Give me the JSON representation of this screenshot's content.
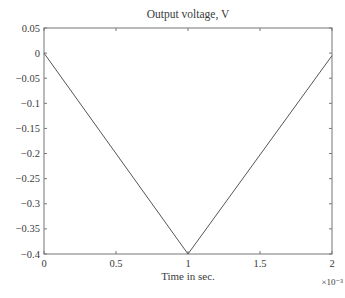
{
  "chart_data": {
    "type": "line",
    "title": "Output voltage, V",
    "xlabel": "Time in sec.",
    "ylabel": "",
    "x_multiplier_label": "×10⁻³",
    "x_exponent": -3,
    "xlim": [
      0,
      2
    ],
    "ylim": [
      -0.4,
      0.05
    ],
    "x_ticks": [
      0,
      0.5,
      1,
      1.5,
      2
    ],
    "x_tick_labels": [
      "0",
      "0.5",
      "1",
      "1.5",
      "2"
    ],
    "y_ticks": [
      0.05,
      0,
      -0.05,
      -0.1,
      -0.15,
      -0.2,
      -0.25,
      -0.3,
      -0.35,
      -0.4
    ],
    "y_tick_labels": [
      "0.05",
      "0",
      "−0.05",
      "−0.1",
      "−0.15",
      "−0.2",
      "−0.25",
      "−0.3",
      "−0.35",
      "−0.4"
    ],
    "grid": false,
    "legend": null,
    "series": [
      {
        "name": "Output voltage",
        "x": [
          0,
          1,
          2
        ],
        "y": [
          0,
          -0.4,
          -0.005
        ],
        "color": "#555555"
      }
    ]
  },
  "colors": {
    "axis": "#777777",
    "line": "#555555",
    "text": "#3a3a3a"
  }
}
